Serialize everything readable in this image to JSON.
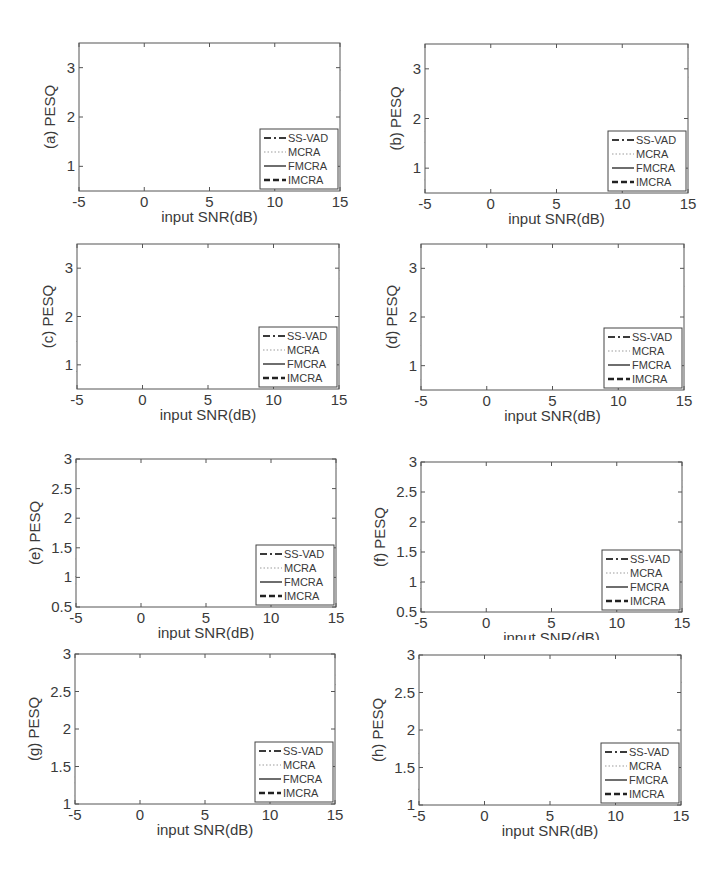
{
  "figure": {
    "series_styles": {
      "SS-VAD": {
        "color": "#3a3a3a",
        "dash": "7 3 2 3",
        "width": 1.8
      },
      "MCRA": {
        "color": "#bdbdbd",
        "dash": "1.5 2",
        "width": 1.4
      },
      "FMCRA": {
        "color": "#6e6e6e",
        "dash": "",
        "width": 2.0
      },
      "IMCRA": {
        "color": "#222222",
        "dash": "6 3",
        "width": 2.4
      }
    }
  },
  "chart_data": [
    {
      "id": "a",
      "type": "line",
      "xlabel": "input SNR(dB)",
      "ylabel": "(a) PESQ",
      "x": [
        -5,
        0,
        5,
        10,
        15
      ],
      "xticks": [
        "-5",
        "0",
        "5",
        "10",
        "15"
      ],
      "ylim": [
        0.5,
        3.5
      ],
      "yticks": [
        1,
        2,
        3
      ],
      "yticklabels": [
        "1",
        "2",
        "3"
      ],
      "grid": true,
      "legend_position": "lower right",
      "series": [
        {
          "name": "SS-VAD",
          "values": [
            0.93,
            1.32,
            2.0,
            2.15,
            2.55
          ]
        },
        {
          "name": "MCRA",
          "values": [
            1.38,
            1.5,
            2.0,
            2.25,
            2.75
          ]
        },
        {
          "name": "FMCRA",
          "values": [
            1.77,
            2.03,
            2.57,
            2.73,
            3.02
          ]
        },
        {
          "name": "IMCRA",
          "values": [
            1.6,
            1.63,
            2.08,
            2.38,
            2.97
          ]
        }
      ]
    },
    {
      "id": "b",
      "type": "line",
      "xlabel": "input SNR(dB)",
      "ylabel": "(b) PESQ",
      "x": [
        -5,
        0,
        5,
        10,
        15
      ],
      "xticks": [
        "-5",
        "0",
        "5",
        "10",
        "15"
      ],
      "ylim": [
        0.5,
        3.5
      ],
      "yticks": [
        1,
        2,
        3
      ],
      "yticklabels": [
        "1",
        "2",
        "3"
      ],
      "grid": true,
      "legend_position": "lower right",
      "series": [
        {
          "name": "SS-VAD",
          "values": [
            0.75,
            1.38,
            1.85,
            2.3,
            2.65
          ]
        },
        {
          "name": "MCRA",
          "values": [
            1.2,
            1.58,
            2.05,
            2.45,
            2.78
          ]
        },
        {
          "name": "FMCRA",
          "values": [
            1.73,
            2.1,
            2.48,
            2.85,
            3.22
          ]
        },
        {
          "name": "IMCRA",
          "values": [
            1.5,
            1.75,
            2.15,
            2.5,
            2.85
          ]
        }
      ]
    },
    {
      "id": "c",
      "type": "line",
      "xlabel": "input SNR(dB)",
      "ylabel": "(c) PESQ",
      "x": [
        -5,
        0,
        5,
        10,
        15
      ],
      "xticks": [
        "-5",
        "0",
        "5",
        "10",
        "15"
      ],
      "ylim": [
        0.5,
        3.5
      ],
      "yticks": [
        1,
        2,
        3
      ],
      "yticklabels": [
        "1",
        "2",
        "3"
      ],
      "grid": true,
      "legend_position": "lower right",
      "series": [
        {
          "name": "SS-VAD",
          "values": [
            0.85,
            1.65,
            2.15,
            2.5,
            2.8
          ]
        },
        {
          "name": "MCRA",
          "values": [
            1.38,
            1.85,
            2.3,
            2.52,
            2.88
          ]
        },
        {
          "name": "FMCRA",
          "values": [
            2.02,
            2.35,
            2.72,
            3.02,
            3.33
          ]
        },
        {
          "name": "IMCRA",
          "values": [
            1.47,
            1.93,
            2.35,
            2.55,
            2.97
          ]
        }
      ]
    },
    {
      "id": "d",
      "type": "line",
      "xlabel": "input SNR(dB)",
      "ylabel": "(d) PESQ",
      "x": [
        -5,
        0,
        5,
        10,
        15
      ],
      "xticks": [
        "-5",
        "0",
        "5",
        "10",
        "15"
      ],
      "ylim": [
        0.5,
        3.5
      ],
      "yticks": [
        1,
        2,
        3
      ],
      "yticklabels": [
        "1",
        "2",
        "3"
      ],
      "grid": true,
      "legend_position": "lower right",
      "series": [
        {
          "name": "SS-VAD",
          "values": [
            0.7,
            1.28,
            1.85,
            2.22,
            2.62
          ]
        },
        {
          "name": "MCRA",
          "values": [
            1.27,
            1.42,
            1.95,
            2.28,
            2.55
          ]
        },
        {
          "name": "FMCRA",
          "values": [
            1.65,
            1.85,
            2.43,
            2.7,
            3.02
          ]
        },
        {
          "name": "IMCRA",
          "values": [
            1.4,
            1.55,
            2.02,
            2.35,
            2.65
          ]
        }
      ]
    },
    {
      "id": "e",
      "type": "line",
      "xlabel": "input SNR(dB)",
      "ylabel": "(e) PESQ",
      "x": [
        -5,
        0,
        5,
        10,
        15
      ],
      "xticks": [
        "-5",
        "0",
        "5",
        "10",
        "15"
      ],
      "ylim": [
        0.5,
        3.0
      ],
      "yticks": [
        0.5,
        1,
        1.5,
        2,
        2.5,
        3
      ],
      "yticklabels": [
        "0.5",
        "1",
        "1.5",
        "2",
        "2.5",
        "3"
      ],
      "grid": true,
      "legend_position": "lower right",
      "series": [
        {
          "name": "SS-VAD",
          "values": [
            0.88,
            1.35,
            1.9,
            2.25,
            2.6
          ]
        },
        {
          "name": "MCRA",
          "values": [
            1.0,
            1.6,
            2.17,
            2.4,
            2.75
          ]
        },
        {
          "name": "FMCRA",
          "values": [
            1.3,
            1.98,
            2.4,
            2.55,
            2.85
          ]
        },
        {
          "name": "IMCRA",
          "values": [
            1.0,
            1.53,
            1.95,
            2.2,
            2.6
          ]
        }
      ]
    },
    {
      "id": "f",
      "type": "line",
      "xlabel": "input SNR(dB)",
      "ylabel": "(f) PESQ",
      "x": [
        -5,
        0,
        5,
        10,
        15
      ],
      "xticks": [
        "-5",
        "0",
        "5",
        "10",
        "15"
      ],
      "ylim": [
        0.5,
        3.0
      ],
      "yticks": [
        0.5,
        1,
        1.5,
        2,
        2.5,
        3
      ],
      "yticklabels": [
        "0.5",
        "1",
        "1.5",
        "2",
        "2.5",
        "3"
      ],
      "grid": true,
      "legend_position": "lower right",
      "series": [
        {
          "name": "SS-VAD",
          "values": [
            0.88,
            1.65,
            1.95,
            2.45,
            2.7
          ]
        },
        {
          "name": "MCRA",
          "values": [
            1.25,
            1.6,
            1.9,
            2.35,
            2.65
          ]
        },
        {
          "name": "FMCRA",
          "values": [
            1.53,
            1.93,
            2.2,
            2.65,
            2.95
          ]
        },
        {
          "name": "IMCRA",
          "values": [
            0.98,
            1.58,
            1.82,
            2.3,
            2.6
          ]
        }
      ]
    },
    {
      "id": "g",
      "type": "line",
      "xlabel": "input SNR(dB)",
      "ylabel": "(g) PESQ",
      "x": [
        -5,
        0,
        5,
        10,
        15
      ],
      "xticks": [
        "-5",
        "0",
        "5",
        "10",
        "15"
      ],
      "ylim": [
        1.0,
        3.0
      ],
      "yticks": [
        1,
        1.5,
        2,
        2.5,
        3
      ],
      "yticklabels": [
        "1",
        "1.5",
        "2",
        "2.5",
        "3"
      ],
      "grid": true,
      "legend_position": "lower right",
      "series": [
        {
          "name": "SS-VAD",
          "values": [
            1.1,
            1.37,
            2.12,
            2.42,
            2.73
          ]
        },
        {
          "name": "MCRA",
          "values": [
            1.3,
            1.42,
            2.05,
            2.35,
            2.68
          ]
        },
        {
          "name": "FMCRA",
          "values": [
            1.35,
            1.65,
            2.28,
            2.55,
            2.95
          ]
        },
        {
          "name": "IMCRA",
          "values": [
            1.27,
            1.42,
            1.97,
            2.25,
            2.6
          ]
        }
      ]
    },
    {
      "id": "h",
      "type": "line",
      "xlabel": "input SNR(dB)",
      "ylabel": "(h) PESQ",
      "x": [
        -5,
        0,
        5,
        10,
        15
      ],
      "xticks": [
        "-5",
        "0",
        "5",
        "10",
        "15"
      ],
      "ylim": [
        1.0,
        3.0
      ],
      "yticks": [
        1,
        1.5,
        2,
        2.5,
        3
      ],
      "yticklabels": [
        "1",
        "1.5",
        "2",
        "2.5",
        "3"
      ],
      "grid": true,
      "legend_position": "lower right",
      "series": [
        {
          "name": "SS-VAD",
          "values": [
            1.03,
            1.62,
            1.95,
            2.45,
            2.75
          ]
        },
        {
          "name": "MCRA",
          "values": [
            1.37,
            1.7,
            1.92,
            2.35,
            2.7
          ]
        },
        {
          "name": "FMCRA",
          "values": [
            1.68,
            2.0,
            2.2,
            2.62,
            2.95
          ]
        },
        {
          "name": "IMCRA",
          "values": [
            1.2,
            1.65,
            1.88,
            2.28,
            2.65
          ]
        }
      ]
    }
  ],
  "legend": {
    "entries": [
      "SS-VAD",
      "MCRA",
      "FMCRA",
      "IMCRA"
    ]
  }
}
